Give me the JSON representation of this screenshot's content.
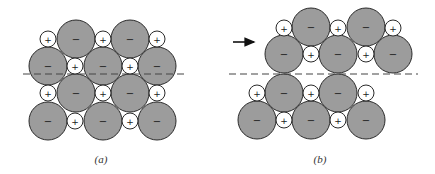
{
  "figure": {
    "panels": [
      {
        "id": "a",
        "caption": "(a)",
        "caption_pos": [
          101,
          160
        ],
        "dashed_line": {
          "x1": 23,
          "x2": 186,
          "y": 74
        },
        "arrow": null,
        "ions": [
          {
            "type": "cation",
            "sign": "+",
            "x": 48,
            "y": 39
          },
          {
            "type": "anion",
            "sign": "−",
            "x": 76,
            "y": 39
          },
          {
            "type": "cation",
            "sign": "+",
            "x": 103,
            "y": 39
          },
          {
            "type": "anion",
            "sign": "−",
            "x": 130,
            "y": 39
          },
          {
            "type": "cation",
            "sign": "+",
            "x": 157,
            "y": 39
          },
          {
            "type": "anion",
            "sign": "−",
            "x": 48,
            "y": 66
          },
          {
            "type": "cation",
            "sign": "+",
            "x": 75,
            "y": 66
          },
          {
            "type": "anion",
            "sign": "−",
            "x": 103,
            "y": 66
          },
          {
            "type": "cation",
            "sign": "+",
            "x": 130,
            "y": 66
          },
          {
            "type": "anion",
            "sign": "−",
            "x": 157,
            "y": 66
          },
          {
            "type": "cation",
            "sign": "+",
            "x": 48,
            "y": 93
          },
          {
            "type": "anion",
            "sign": "−",
            "x": 76,
            "y": 93
          },
          {
            "type": "cation",
            "sign": "+",
            "x": 103,
            "y": 93
          },
          {
            "type": "anion",
            "sign": "−",
            "x": 130,
            "y": 93
          },
          {
            "type": "cation",
            "sign": "+",
            "x": 157,
            "y": 93
          },
          {
            "type": "anion",
            "sign": "−",
            "x": 48,
            "y": 121
          },
          {
            "type": "cation",
            "sign": "+",
            "x": 75,
            "y": 121
          },
          {
            "type": "anion",
            "sign": "−",
            "x": 103,
            "y": 121
          },
          {
            "type": "cation",
            "sign": "+",
            "x": 130,
            "y": 121
          },
          {
            "type": "anion",
            "sign": "−",
            "x": 157,
            "y": 121
          }
        ]
      },
      {
        "id": "b",
        "caption": "(b)",
        "caption_pos": [
          320,
          160
        ],
        "dashed_line": {
          "x1": 229,
          "x2": 418,
          "y": 74
        },
        "arrow": {
          "x1": 233,
          "x2": 258,
          "y": 42,
          "direction": "right"
        },
        "ions": [
          {
            "type": "cation",
            "sign": "+",
            "x": 284,
            "y": 28
          },
          {
            "type": "anion",
            "sign": "−",
            "x": 311,
            "y": 27
          },
          {
            "type": "cation",
            "sign": "+",
            "x": 338,
            "y": 28
          },
          {
            "type": "anion",
            "sign": "−",
            "x": 366,
            "y": 27
          },
          {
            "type": "cation",
            "sign": "+",
            "x": 393,
            "y": 28
          },
          {
            "type": "anion",
            "sign": "−",
            "x": 284,
            "y": 54
          },
          {
            "type": "cation",
            "sign": "+",
            "x": 311,
            "y": 54
          },
          {
            "type": "anion",
            "sign": "−",
            "x": 338,
            "y": 54
          },
          {
            "type": "cation",
            "sign": "+",
            "x": 366,
            "y": 54
          },
          {
            "type": "anion",
            "sign": "−",
            "x": 393,
            "y": 54
          },
          {
            "type": "cation",
            "sign": "+",
            "x": 257,
            "y": 93
          },
          {
            "type": "anion",
            "sign": "−",
            "x": 284,
            "y": 93
          },
          {
            "type": "cation",
            "sign": "+",
            "x": 311,
            "y": 93
          },
          {
            "type": "anion",
            "sign": "−",
            "x": 338,
            "y": 93
          },
          {
            "type": "cation",
            "sign": "+",
            "x": 366,
            "y": 93
          },
          {
            "type": "anion",
            "sign": "−",
            "x": 257,
            "y": 120
          },
          {
            "type": "cation",
            "sign": "+",
            "x": 284,
            "y": 120
          },
          {
            "type": "anion",
            "sign": "−",
            "x": 311,
            "y": 120
          },
          {
            "type": "cation",
            "sign": "+",
            "x": 338,
            "y": 120
          },
          {
            "type": "anion",
            "sign": "−",
            "x": 366,
            "y": 120
          }
        ]
      }
    ],
    "radii": {
      "anion": 19,
      "cation": 8
    },
    "colors": {
      "anion_fill": "#9c9c9c",
      "cation_fill": "#ffffff",
      "outline": "#2a2a2a",
      "dash": "#444444"
    }
  }
}
